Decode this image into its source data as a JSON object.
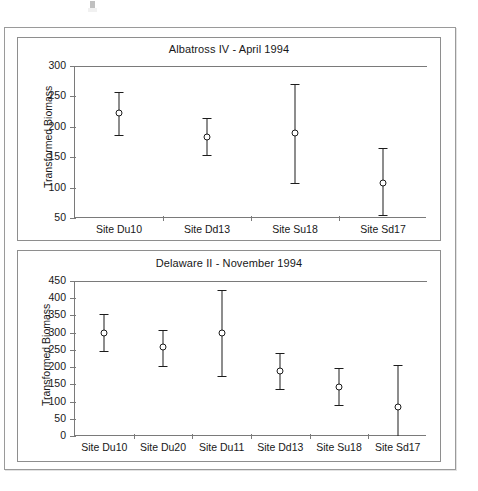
{
  "figure": {
    "ylabel": "Transformed Biomass"
  },
  "chart_data": [
    {
      "type": "scatter",
      "title": "Albatross IV - April 1994",
      "xlabel": "",
      "ylabel": "Transformed Biomass",
      "ylim": [
        50,
        300
      ],
      "yticks": [
        50,
        100,
        150,
        200,
        250,
        300
      ],
      "grid": false,
      "legend": null,
      "categories": [
        "Site Du10",
        "Site Dd13",
        "Site Su18",
        "Site Sd17"
      ],
      "values": [
        222,
        184,
        189,
        108
      ],
      "error_low": [
        187,
        153,
        107,
        55
      ],
      "error_high": [
        257,
        215,
        271,
        165
      ]
    },
    {
      "type": "scatter",
      "title": "Delaware II - November 1994",
      "xlabel": "",
      "ylabel": "Transformed Biomass",
      "ylim": [
        0,
        450
      ],
      "yticks": [
        0,
        50,
        100,
        150,
        200,
        250,
        300,
        350,
        400,
        450
      ],
      "grid": false,
      "legend": null,
      "categories": [
        "Site Du10",
        "Site Du20",
        "Site Du11",
        "Site Dd13",
        "Site Su18",
        "Site Sd17"
      ],
      "values": [
        300,
        258,
        299,
        188,
        143,
        83
      ],
      "error_low": [
        246,
        204,
        175,
        136,
        91,
        0
      ],
      "error_high": [
        353,
        309,
        423,
        241,
        196,
        205
      ]
    }
  ]
}
